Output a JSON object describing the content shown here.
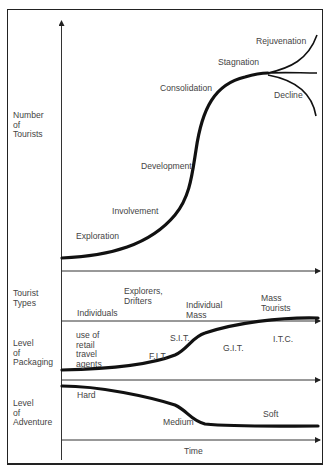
{
  "diagram": {
    "row_labels": {
      "tourists": "Number\nof\nTourists",
      "types": "Tourist\nTypes",
      "packaging": "Level\nof\nPackaging",
      "adventure": "Level\nof\nAdventure"
    },
    "lifecycle_stages": {
      "exploration": "Exploration",
      "involvement": "Involvement",
      "development": "Development",
      "consolidation": "Consolidation",
      "stagnation": "Stagnation",
      "rejuvenation": "Rejuvenation",
      "decline": "Decline"
    },
    "tourist_types": {
      "individuals": "Individuals",
      "explorers": "Explorers,\nDrifters",
      "individual_mass": "Individual\nMass",
      "mass_tourists": "Mass\nTourists"
    },
    "packaging": {
      "retail": "use of\nretail\ntravel\nagents",
      "fit": "F.I.T.",
      "sit": "S.I.T.",
      "git": "G.I.T.",
      "itc": "I.T.C."
    },
    "adventure": {
      "hard": "Hard",
      "medium": "Medium",
      "soft": "Soft"
    },
    "x_axis_label": "Time",
    "colors": {
      "line": "#111111",
      "text": "#444444",
      "border": "#222222"
    }
  }
}
